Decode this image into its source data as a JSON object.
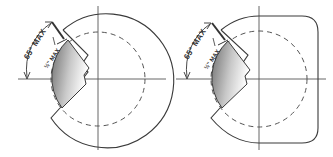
{
  "figures": [
    {
      "id": "round",
      "shape": "circle",
      "angle_label": "65° MAX",
      "depth_label": "½\" MAX"
    },
    {
      "id": "rounded-square",
      "shape": "rounded-rectangle",
      "angle_label": "65° MAX",
      "depth_label": "½\" MAX"
    }
  ],
  "colors": {
    "outline": "#3a3a3a",
    "shade_dark": "#6e6e6e",
    "shade_light": "#ffffff",
    "background": "#ffffff"
  }
}
